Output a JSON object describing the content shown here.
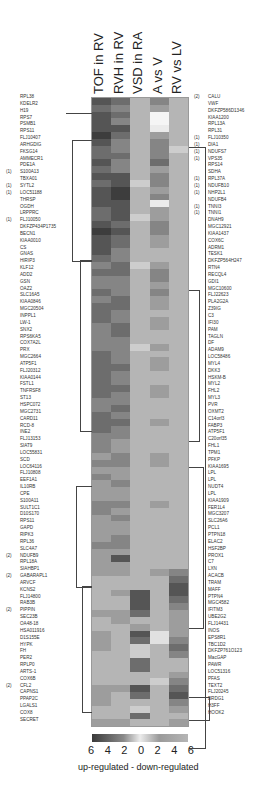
{
  "chart_data": {
    "type": "heatmap",
    "title": "",
    "columns": [
      "TOF in RV",
      "RVH in RV",
      "VSD in RA",
      "A vs V",
      "RV vs LV"
    ],
    "colorbar": {
      "ticks": [
        "6",
        "4",
        "2",
        "0",
        "2",
        "4",
        "6"
      ],
      "caption": "up-regulated  -  down-regulated",
      "low_color": "#3a3a3a",
      "mid_color": "#ececec",
      "high_color": "#b5b5b5"
    },
    "left_labels": [
      {
        "m": "",
        "g": "RPL38"
      },
      {
        "m": "",
        "g": "KDELR2"
      },
      {
        "m": "",
        "g": "H19"
      },
      {
        "m": "",
        "g": "RPS7"
      },
      {
        "m": "",
        "g": "PSMB1"
      },
      {
        "m": "",
        "g": "RPS11"
      },
      {
        "m": "",
        "g": "FLJ10407"
      },
      {
        "m": "",
        "g": "ARHGDIG"
      },
      {
        "m": "",
        "g": "FKSG14"
      },
      {
        "m": "",
        "g": "AMMECR1"
      },
      {
        "m": "",
        "g": "PDE1A"
      },
      {
        "m": "(1)",
        "g": "S100A13"
      },
      {
        "m": "",
        "g": "TBXA01"
      },
      {
        "m": "(1)",
        "g": "SYTL2"
      },
      {
        "m": "(1)",
        "g": "LOC51188"
      },
      {
        "m": "",
        "g": "THRSP"
      },
      {
        "m": "",
        "g": "OGDH"
      },
      {
        "m": "",
        "g": "LRPPRC"
      },
      {
        "m": "(1)",
        "g": "FLJ10050"
      },
      {
        "m": "",
        "g": "DKFZP434P1735"
      },
      {
        "m": "",
        "g": "BECN1"
      },
      {
        "m": "",
        "g": "KIAA0010"
      },
      {
        "m": "",
        "g": "CS"
      },
      {
        "m": "",
        "g": "GNAS"
      },
      {
        "m": "",
        "g": "HIRIP3"
      },
      {
        "m": "",
        "g": "KLF12"
      },
      {
        "m": "",
        "g": "ADD2"
      },
      {
        "m": "",
        "g": "GSN"
      },
      {
        "m": "",
        "g": "OAZ2"
      },
      {
        "m": "",
        "g": "SLC16A5"
      },
      {
        "m": "",
        "g": "KIAA0846"
      },
      {
        "m": "",
        "g": "MGC20504"
      },
      {
        "m": "",
        "g": "INPPL1"
      },
      {
        "m": "",
        "g": "LW-1"
      },
      {
        "m": "",
        "g": "SNX2"
      },
      {
        "m": "",
        "g": "RPS6KA5"
      },
      {
        "m": "",
        "g": "COX7A2L"
      },
      {
        "m": "",
        "g": "PRX"
      },
      {
        "m": "",
        "g": "MGC2664"
      },
      {
        "m": "",
        "g": "ATP5F1"
      },
      {
        "m": "",
        "g": "FLJ20312"
      },
      {
        "m": "",
        "g": "KIAA0144"
      },
      {
        "m": "",
        "g": "FSTL1"
      },
      {
        "m": "",
        "g": "TNFRSF8"
      },
      {
        "m": "",
        "g": "ST13"
      },
      {
        "m": "",
        "g": "HSPC072"
      },
      {
        "m": "",
        "g": "MGC2731"
      },
      {
        "m": "",
        "g": "CARD11"
      },
      {
        "m": "",
        "g": "RCD-8"
      },
      {
        "m": "",
        "g": "INE2"
      },
      {
        "m": "",
        "g": "FLJ13153"
      },
      {
        "m": "",
        "g": "SIAT9"
      },
      {
        "m": "",
        "g": "LOC55831"
      },
      {
        "m": "",
        "g": "SCD"
      },
      {
        "m": "",
        "g": "LOC64116"
      },
      {
        "m": "",
        "g": "FLJ10808"
      },
      {
        "m": "",
        "g": "EEF1A1"
      },
      {
        "m": "",
        "g": "IL10RB"
      },
      {
        "m": "",
        "g": "CPE"
      },
      {
        "m": "",
        "g": "S100A11"
      },
      {
        "m": "",
        "g": "SULT1C1"
      },
      {
        "m": "",
        "g": "D10S170"
      },
      {
        "m": "",
        "g": "RPS11"
      },
      {
        "m": "",
        "g": "GAPD"
      },
      {
        "m": "",
        "g": "RIPK3"
      },
      {
        "m": "",
        "g": "RPL36"
      },
      {
        "m": "",
        "g": "SLC4A7"
      },
      {
        "m": "(2)",
        "g": "NDUFB9"
      },
      {
        "m": "",
        "g": "RPL18A"
      },
      {
        "m": "",
        "g": "SIAHBP1"
      },
      {
        "m": "(2)",
        "g": "GABARAPL1"
      },
      {
        "m": "",
        "g": "ARVCF"
      },
      {
        "m": "",
        "g": "KCNS2"
      },
      {
        "m": "",
        "g": "FLJ14800"
      },
      {
        "m": "",
        "g": "RAB3B"
      },
      {
        "m": "(2)",
        "g": "PIPPIN"
      },
      {
        "m": "",
        "g": "SEC23B"
      },
      {
        "m": "",
        "g": "OA48-18"
      },
      {
        "m": "",
        "g": "HSA011916"
      },
      {
        "m": "",
        "g": "D1S155E"
      },
      {
        "m": "",
        "g": "HYPK"
      },
      {
        "m": "",
        "g": "FH"
      },
      {
        "m": "",
        "g": "PER2"
      },
      {
        "m": "",
        "g": "RPLP0"
      },
      {
        "m": "",
        "g": "ARTS-1"
      },
      {
        "m": "",
        "g": "COX6B"
      },
      {
        "m": "(2)",
        "g": "CFL2"
      },
      {
        "m": "",
        "g": "CAPNS1"
      },
      {
        "m": "",
        "g": "PPAP2C"
      },
      {
        "m": "",
        "g": "LGALS1"
      },
      {
        "m": "",
        "g": "COX8"
      },
      {
        "m": "",
        "g": "SECRET"
      }
    ],
    "right_labels": [
      {
        "m": "(2)",
        "g": "CALU"
      },
      {
        "m": "",
        "g": "VWF"
      },
      {
        "m": "",
        "g": "DKFZP586D1346"
      },
      {
        "m": "",
        "g": "KIAA1200"
      },
      {
        "m": "",
        "g": "RPL13A"
      },
      {
        "m": "",
        "g": "RPL31"
      },
      {
        "m": "(1)",
        "g": "FLJ10350"
      },
      {
        "m": "(1)",
        "g": "DIA1"
      },
      {
        "m": "(1)",
        "g": "NDUFS7"
      },
      {
        "m": "(1)",
        "g": "VPS35"
      },
      {
        "m": "",
        "g": "RPS14"
      },
      {
        "m": "",
        "g": "SDHA"
      },
      {
        "m": "(1)",
        "g": "RPL37A"
      },
      {
        "m": "(1)",
        "g": "NDUFB10"
      },
      {
        "m": "(1)",
        "g": "NHP2L1"
      },
      {
        "m": "",
        "g": "NDUFB4"
      },
      {
        "m": "(1)",
        "g": "TNNI3"
      },
      {
        "m": "(1)",
        "g": "TNNI1"
      },
      {
        "m": "",
        "g": "DNAH9"
      },
      {
        "m": "",
        "g": "MGC12921"
      },
      {
        "m": "",
        "g": "KIAA1437"
      },
      {
        "m": "",
        "g": "COX6C"
      },
      {
        "m": "",
        "g": "ADRM1"
      },
      {
        "m": "",
        "g": "TESK1"
      },
      {
        "m": "",
        "g": "DKFZP564H247"
      },
      {
        "m": "",
        "g": "RTN4"
      },
      {
        "m": "",
        "g": "RECQL4"
      },
      {
        "m": "",
        "g": "GDI1"
      },
      {
        "m": "",
        "g": "MGC10600"
      },
      {
        "m": "",
        "g": "FLJ22623"
      },
      {
        "m": "",
        "g": "PLA2G2A"
      },
      {
        "m": "",
        "g": "Z39IG"
      },
      {
        "m": "",
        "g": "C3"
      },
      {
        "m": "",
        "g": "IFI30"
      },
      {
        "m": "",
        "g": "PAM"
      },
      {
        "m": "",
        "g": "TAGLN"
      },
      {
        "m": "",
        "g": "DF"
      },
      {
        "m": "",
        "g": "ADAM9"
      },
      {
        "m": "",
        "g": "LOC58486"
      },
      {
        "m": "",
        "g": "MYL4"
      },
      {
        "m": "",
        "g": "DKK3"
      },
      {
        "m": "",
        "g": "HSKM-B"
      },
      {
        "m": "",
        "g": "MYL2"
      },
      {
        "m": "",
        "g": "FHL2"
      },
      {
        "m": "",
        "g": "MYL3"
      },
      {
        "m": "",
        "g": "PVR"
      },
      {
        "m": "",
        "g": "OXMT2"
      },
      {
        "m": "",
        "g": "C14orf3"
      },
      {
        "m": "",
        "g": "FABP3"
      },
      {
        "m": "",
        "g": "ATP5F1"
      },
      {
        "m": "",
        "g": "C20orf35"
      },
      {
        "m": "",
        "g": "FHL1"
      },
      {
        "m": "",
        "g": "TPM1"
      },
      {
        "m": "",
        "g": "PFKP"
      },
      {
        "m": "",
        "g": "KIAA1695"
      },
      {
        "m": "",
        "g": "LPL"
      },
      {
        "m": "",
        "g": "LPL"
      },
      {
        "m": "",
        "g": "NUDT4"
      },
      {
        "m": "",
        "g": "LPL"
      },
      {
        "m": "",
        "g": "KIAA1909"
      },
      {
        "m": "",
        "g": "FER1L4"
      },
      {
        "m": "",
        "g": "MGC3207"
      },
      {
        "m": "",
        "g": "SLC26A6"
      },
      {
        "m": "",
        "g": "PCL1"
      },
      {
        "m": "",
        "g": "PTPN18"
      },
      {
        "m": "",
        "g": "ELAC2"
      },
      {
        "m": "",
        "g": "HSF2BP"
      },
      {
        "m": "",
        "g": "PROX1"
      },
      {
        "m": "",
        "g": "C7"
      },
      {
        "m": "",
        "g": "LXN"
      },
      {
        "m": "",
        "g": "ACACB"
      },
      {
        "m": "",
        "g": "TRAM"
      },
      {
        "m": "",
        "g": "MAFF"
      },
      {
        "m": "",
        "g": "PTPN4"
      },
      {
        "m": "",
        "g": "MGC4582"
      },
      {
        "m": "",
        "g": "IFITM3"
      },
      {
        "m": "",
        "g": "UBE2G2"
      },
      {
        "m": "",
        "g": "FLJ14431"
      },
      {
        "m": "",
        "g": "INOS"
      },
      {
        "m": "",
        "g": "EPS8R1"
      },
      {
        "m": "",
        "g": "TBC1D2"
      },
      {
        "m": "",
        "g": "DKFZP761O123"
      },
      {
        "m": "",
        "g": "MacGAP"
      },
      {
        "m": "",
        "g": "PAWR"
      },
      {
        "m": "",
        "g": "LOC51316"
      },
      {
        "m": "",
        "g": "PFAS"
      },
      {
        "m": "",
        "g": "TEXT2"
      },
      {
        "m": "",
        "g": "FLJ20245"
      },
      {
        "m": "",
        "g": "BRDG1"
      },
      {
        "m": "",
        "g": "H3FF"
      },
      {
        "m": "",
        "g": "HOOK2"
      }
    ],
    "values_description": "Grayscale fold-change blocks per column; dark = up-regulated, light = down-regulated",
    "columns_values": [
      [
        5,
        4,
        5,
        5,
        5,
        6,
        5,
        4,
        4,
        5,
        4,
        5,
        4,
        5,
        5,
        5,
        4,
        4,
        5,
        6,
        5,
        5,
        5,
        4,
        3,
        4,
        3,
        3,
        4,
        3,
        4,
        4,
        4,
        3,
        3,
        3,
        3,
        4,
        4,
        4,
        4,
        4,
        4,
        4,
        3,
        3,
        4,
        4,
        4,
        3,
        3,
        3,
        2,
        3,
        2,
        3,
        2,
        2,
        2,
        3,
        3,
        2,
        2,
        2,
        2,
        3,
        2,
        2,
        2,
        2,
        1,
        1,
        1,
        1,
        1,
        2,
        1,
        1,
        2,
        2,
        2,
        1,
        1,
        1,
        1,
        1,
        2,
        2,
        2,
        1,
        1,
        2
      ],
      [
        4,
        3,
        4,
        3,
        5,
        4,
        3,
        3,
        4,
        3,
        3,
        5,
        5,
        6,
        6,
        5,
        5,
        5,
        4,
        5,
        4,
        4,
        3,
        3,
        4,
        4,
        3,
        3,
        3,
        4,
        4,
        3,
        3,
        4,
        4,
        3,
        3,
        3,
        3,
        4,
        3,
        3,
        4,
        3,
        3,
        4,
        3,
        4,
        3,
        3,
        2,
        2,
        3,
        3,
        2,
        2,
        3,
        2,
        2,
        3,
        2,
        3,
        2,
        2,
        3,
        3,
        2,
        5,
        2,
        2,
        1,
        1,
        2,
        1,
        1,
        2,
        2,
        1,
        1,
        1,
        1,
        1,
        1,
        1,
        1,
        1,
        2,
        1,
        1,
        1,
        1,
        2
      ],
      [
        1,
        1,
        1,
        1,
        1,
        1,
        1,
        1,
        1,
        1,
        1,
        1,
        0,
        1,
        1,
        1,
        1,
        0,
        1,
        1,
        1,
        1,
        1,
        1,
        0,
        1,
        1,
        1,
        1,
        1,
        1,
        1,
        1,
        1,
        1,
        1,
        0,
        1,
        1,
        1,
        1,
        1,
        1,
        1,
        1,
        1,
        1,
        1,
        1,
        1,
        1,
        1,
        1,
        1,
        1,
        1,
        1,
        1,
        1,
        1,
        1,
        1,
        1,
        1,
        1,
        1,
        1,
        1,
        1,
        1,
        1,
        1,
        5,
        5,
        5,
        4,
        1,
        2,
        5,
        4,
        0,
        0,
        4,
        4,
        1,
        1,
        5,
        4,
        1,
        0,
        4,
        1
      ],
      [
        3,
        2,
        -3,
        -3,
        -2,
        2,
        3,
        3,
        3,
        4,
        2,
        3,
        3,
        2,
        3,
        -2,
        2,
        2,
        3,
        3,
        2,
        2,
        1,
        1,
        2,
        3,
        3,
        2,
        3,
        2,
        2,
        1,
        2,
        2,
        1,
        1,
        2,
        1,
        2,
        2,
        1,
        1,
        2,
        2,
        1,
        1,
        1,
        2,
        1,
        1,
        1,
        1,
        2,
        2,
        1,
        1,
        1,
        1,
        1,
        2,
        1,
        1,
        1,
        1,
        1,
        1,
        1,
        1,
        1,
        2,
        1,
        1,
        1,
        1,
        1,
        1,
        1,
        1,
        -1,
        -1,
        1,
        1,
        1,
        1,
        1,
        0,
        1,
        1,
        1,
        1,
        1,
        1
      ],
      [
        1,
        1,
        1,
        1,
        1,
        1,
        1,
        0,
        1,
        1,
        1,
        1,
        1,
        1,
        1,
        1,
        1,
        1,
        1,
        1,
        1,
        1,
        1,
        1,
        1,
        1,
        1,
        1,
        1,
        1,
        1,
        1,
        1,
        1,
        1,
        1,
        1,
        1,
        1,
        1,
        1,
        1,
        1,
        1,
        1,
        1,
        1,
        1,
        1,
        1,
        1,
        1,
        1,
        1,
        1,
        1,
        1,
        1,
        1,
        1,
        1,
        1,
        1,
        1,
        1,
        1,
        1,
        1,
        1,
        3,
        4,
        5,
        5,
        4,
        3,
        2,
        2,
        2,
        2,
        3,
        4,
        3,
        1,
        1,
        2,
        3,
        4,
        5,
        3,
        2,
        1,
        2
      ]
    ],
    "xlabel": "",
    "ylabel": ""
  }
}
